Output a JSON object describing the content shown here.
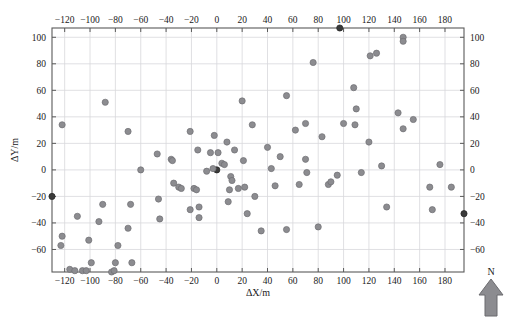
{
  "chart_data": {
    "type": "scatter",
    "title": "",
    "xlabel": "ΔX/m",
    "ylabel": "ΔY/m",
    "xlim": [
      -130,
      195
    ],
    "ylim": [
      -77,
      107
    ],
    "grid": true,
    "legend": null,
    "xticks": [
      -120,
      -100,
      -80,
      -60,
      -40,
      -20,
      0,
      20,
      40,
      60,
      80,
      100,
      120,
      140,
      160,
      180
    ],
    "yticks": [
      -60,
      -40,
      -20,
      0,
      20,
      40,
      60,
      80,
      100
    ],
    "xticks_top": [
      -120,
      -100,
      -80,
      -60,
      -40,
      -20,
      0,
      20,
      40,
      60,
      80,
      100,
      120,
      140,
      160,
      180
    ],
    "yticks_right": [
      -60,
      -40,
      -20,
      0,
      20,
      40,
      60,
      80,
      100
    ],
    "xtick_labels": [
      "−120",
      "−100",
      "−80",
      "−60",
      "−40",
      "−20",
      "0",
      "20",
      "40",
      "60",
      "80",
      "100",
      "120",
      "140",
      "160",
      "180"
    ],
    "ytick_labels": [
      "−60",
      "−40",
      "−20",
      "0",
      "20",
      "40",
      "60",
      "80",
      "100"
    ],
    "marker": {
      "shape": "circle",
      "radius": 3.1,
      "fill": "#8c8c90",
      "stroke": "#6e6e72",
      "origin_fill": "#3a3a3a",
      "origin_stroke": "#242424"
    },
    "annotations": [
      {
        "name": "north-arrow",
        "label": "N"
      }
    ],
    "points": [
      {
        "x": -130,
        "y": -20,
        "highlight": true
      },
      {
        "x": 0,
        "y": 0,
        "highlight": true
      },
      {
        "x": 97,
        "y": 107,
        "highlight": true
      },
      {
        "x": 195,
        "y": -33,
        "highlight": true
      },
      {
        "x": -122,
        "y": 34
      },
      {
        "x": -122,
        "y": -50
      },
      {
        "x": -123,
        "y": -57
      },
      {
        "x": -116,
        "y": -75
      },
      {
        "x": -110,
        "y": -35
      },
      {
        "x": -112,
        "y": -76
      },
      {
        "x": -106,
        "y": -76
      },
      {
        "x": -103,
        "y": -76
      },
      {
        "x": -101,
        "y": -53
      },
      {
        "x": -99,
        "y": -70
      },
      {
        "x": -93,
        "y": -39
      },
      {
        "x": -90,
        "y": -26
      },
      {
        "x": -88,
        "y": 51
      },
      {
        "x": -83,
        "y": -77
      },
      {
        "x": -81,
        "y": -76
      },
      {
        "x": -80,
        "y": -70
      },
      {
        "x": -78,
        "y": -57
      },
      {
        "x": -70,
        "y": 29
      },
      {
        "x": -70,
        "y": -44
      },
      {
        "x": -68,
        "y": -26
      },
      {
        "x": -67,
        "y": -70
      },
      {
        "x": -60,
        "y": 0
      },
      {
        "x": -47,
        "y": 12
      },
      {
        "x": -46,
        "y": -22
      },
      {
        "x": -45,
        "y": -37
      },
      {
        "x": -36,
        "y": 8
      },
      {
        "x": -35,
        "y": 7
      },
      {
        "x": -34,
        "y": -10
      },
      {
        "x": -30,
        "y": -13
      },
      {
        "x": -28,
        "y": -14
      },
      {
        "x": -21,
        "y": 29
      },
      {
        "x": -21,
        "y": -30
      },
      {
        "x": -18,
        "y": -14
      },
      {
        "x": -16,
        "y": -15
      },
      {
        "x": -15,
        "y": 15
      },
      {
        "x": -14,
        "y": -28
      },
      {
        "x": -14,
        "y": -36
      },
      {
        "x": -8,
        "y": -1
      },
      {
        "x": -5,
        "y": 13
      },
      {
        "x": -3,
        "y": 1
      },
      {
        "x": -2,
        "y": 26
      },
      {
        "x": 1,
        "y": 13
      },
      {
        "x": 4,
        "y": 5
      },
      {
        "x": 6,
        "y": 4
      },
      {
        "x": 8,
        "y": 21
      },
      {
        "x": 9,
        "y": -24
      },
      {
        "x": 10,
        "y": -15
      },
      {
        "x": 11,
        "y": -5
      },
      {
        "x": 12,
        "y": -8
      },
      {
        "x": 14,
        "y": 15
      },
      {
        "x": 17,
        "y": -14
      },
      {
        "x": 20,
        "y": 52
      },
      {
        "x": 21,
        "y": 7
      },
      {
        "x": 22,
        "y": -13
      },
      {
        "x": 24,
        "y": -33
      },
      {
        "x": 28,
        "y": 34
      },
      {
        "x": 30,
        "y": -20
      },
      {
        "x": 35,
        "y": -46
      },
      {
        "x": 40,
        "y": 17
      },
      {
        "x": 43,
        "y": 1
      },
      {
        "x": 46,
        "y": -12
      },
      {
        "x": 50,
        "y": 10
      },
      {
        "x": 55,
        "y": 56
      },
      {
        "x": 55,
        "y": -45
      },
      {
        "x": 62,
        "y": 30
      },
      {
        "x": 65,
        "y": -11
      },
      {
        "x": 70,
        "y": 35
      },
      {
        "x": 70,
        "y": 8
      },
      {
        "x": 71,
        "y": -2
      },
      {
        "x": 76,
        "y": 81
      },
      {
        "x": 80,
        "y": -43
      },
      {
        "x": 83,
        "y": 25
      },
      {
        "x": 88,
        "y": -11
      },
      {
        "x": 90,
        "y": -9
      },
      {
        "x": 95,
        "y": -4
      },
      {
        "x": 100,
        "y": 35
      },
      {
        "x": 108,
        "y": 62
      },
      {
        "x": 109,
        "y": 34
      },
      {
        "x": 110,
        "y": 46
      },
      {
        "x": 114,
        "y": -2
      },
      {
        "x": 120,
        "y": 21
      },
      {
        "x": 121,
        "y": 86
      },
      {
        "x": 126,
        "y": 88
      },
      {
        "x": 134,
        "y": -28
      },
      {
        "x": 130,
        "y": 3
      },
      {
        "x": 143,
        "y": 43
      },
      {
        "x": 147,
        "y": 100
      },
      {
        "x": 147,
        "y": 97
      },
      {
        "x": 147,
        "y": 31
      },
      {
        "x": 155,
        "y": 38
      },
      {
        "x": 168,
        "y": -13
      },
      {
        "x": 170,
        "y": -30
      },
      {
        "x": 176,
        "y": 4
      },
      {
        "x": 185,
        "y": -13
      }
    ]
  }
}
